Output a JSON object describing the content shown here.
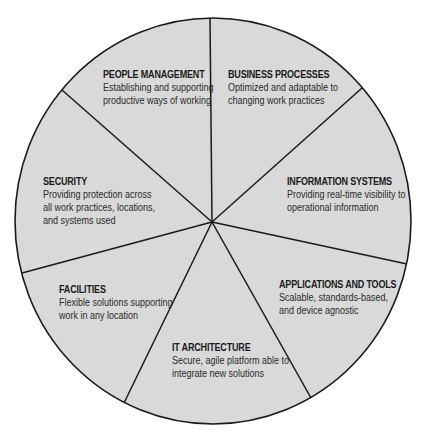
{
  "diagram": {
    "type": "segmented-circle",
    "fill_color": "#d9d9d9",
    "stroke_color": "#1a1a1a",
    "segments": [
      {
        "title": "PEOPLE MANAGEMENT",
        "desc_lines": [
          "Establishing and supporting",
          "productive ways of working"
        ]
      },
      {
        "title": "BUSINESS PROCESSES",
        "desc_lines": [
          "Optimized and adaptable to",
          "changing work practices"
        ]
      },
      {
        "title": "INFORMATION SYSTEMS",
        "desc_lines": [
          "Providing real-time visibility to",
          "operational information"
        ]
      },
      {
        "title": "APPLICATIONS AND TOOLS",
        "desc_lines": [
          "Scalable, standards-based,",
          "and device agnostic"
        ]
      },
      {
        "title": "IT ARCHITECTURE",
        "desc_lines": [
          "Secure, agile platform able to",
          "integrate new solutions"
        ]
      },
      {
        "title": "FACILITIES",
        "desc_lines": [
          "Flexible solutions supporting",
          "work in any location"
        ]
      },
      {
        "title": "SECURITY",
        "desc_lines": [
          "Providing protection across",
          "all work practices, locations,",
          "and systems used"
        ]
      }
    ]
  }
}
